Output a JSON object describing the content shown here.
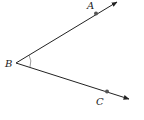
{
  "diagram": {
    "type": "angle",
    "vertex": {
      "label": "B",
      "x": 16,
      "y": 63
    },
    "rays": [
      {
        "name": "BA",
        "point_label": "A",
        "point": {
          "x": 96,
          "y": 13
        },
        "end": {
          "x": 117,
          "y": 1
        }
      },
      {
        "name": "BC",
        "point_label": "C",
        "point": {
          "x": 107,
          "y": 92
        },
        "end": {
          "x": 129,
          "y": 99
        }
      }
    ],
    "angle_mark": "single-arc",
    "colors": {
      "stroke": "#222222",
      "point": "#555555"
    }
  }
}
